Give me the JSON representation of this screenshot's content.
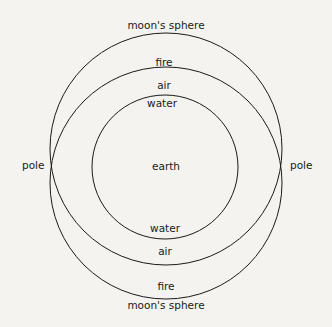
{
  "diagram": {
    "type": "nested-spheres",
    "colors": {
      "stroke": "#1a1a1a",
      "background": "#f4f3f0",
      "text": "#1a1a1a"
    },
    "labels": {
      "top_moon": "moon's sphere",
      "top_fire": "fire",
      "top_air": "air",
      "top_water": "water",
      "center": "earth",
      "bottom_water": "water",
      "bottom_air": "air",
      "bottom_fire": "fire",
      "bottom_moon": "moon's sphere",
      "left_pole": "pole",
      "right_pole": "pole"
    },
    "circles": [
      {
        "name": "upper-sphere",
        "cx": 166,
        "cy": 150,
        "r": 115
      },
      {
        "name": "lower-sphere",
        "cx": 166,
        "cy": 182,
        "r": 115
      },
      {
        "name": "earth",
        "cx": 165,
        "cy": 167,
        "rx": 73,
        "ry": 72
      }
    ]
  }
}
